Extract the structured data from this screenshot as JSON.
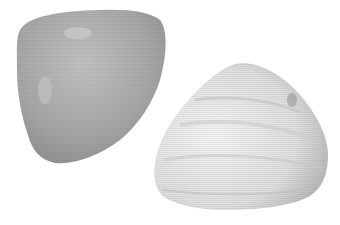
{
  "image": {
    "subject": "two clam shells",
    "background_color": "#ffffff",
    "shells": [
      {
        "name": "left-shell",
        "fill": "#a9a9a9",
        "highlight": "#c8c8c8",
        "shadow": "#8a8a8a"
      },
      {
        "name": "right-shell",
        "fill": "#dcdcdc",
        "highlight": "#f2f2f2",
        "shadow": "#9a9a9a"
      }
    ]
  }
}
